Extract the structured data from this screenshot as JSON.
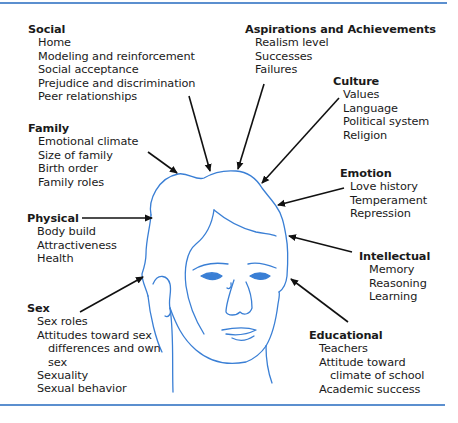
{
  "diagram": {
    "type": "influences-on-self-concept",
    "colors": {
      "rule": "#5b8fcf",
      "face_line": "#3a7fd5",
      "arrow": "#111111",
      "text": "#1a1a1a"
    },
    "groups": {
      "social": {
        "title": "Social",
        "items": [
          "Home",
          "Modeling and reinforcement",
          "Social acceptance",
          "Prejudice and discrimination",
          "Peer relationships"
        ]
      },
      "family": {
        "title": "Family",
        "items": [
          "Emotional climate",
          "Size of family",
          "Birth order",
          "Family roles"
        ]
      },
      "physical": {
        "title": "Physical",
        "items": [
          "Body build",
          "Attractiveness",
          "Health"
        ]
      },
      "sex": {
        "title": "Sex",
        "items": [
          "Sex roles",
          "Attitudes toward sex",
          "differences and own",
          "sex",
          "Sexuality",
          "Sexual behavior"
        ]
      },
      "aspirations": {
        "title": "Aspirations and Achievements",
        "items": [
          "Realism level",
          "Successes",
          "Failures"
        ]
      },
      "culture": {
        "title": "Culture",
        "items": [
          "Values",
          "Language",
          "Political system",
          "Religion"
        ]
      },
      "emotion": {
        "title": "Emotion",
        "items": [
          "Love history",
          "Temperament",
          "Repression"
        ]
      },
      "intellectual": {
        "title": "Intellectual",
        "items": [
          "Memory",
          "Reasoning",
          "Learning"
        ]
      },
      "educational": {
        "title": "Educational",
        "items": [
          "Teachers",
          "Attitude toward",
          "climate of school",
          "Academic success"
        ]
      }
    },
    "center_image": "face-line-drawing"
  }
}
